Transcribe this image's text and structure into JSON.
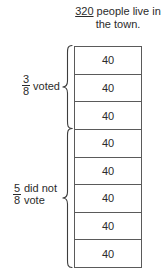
{
  "caption": {
    "total": "320",
    "text": " people live in the town."
  },
  "bar": {
    "cells": [
      {
        "value": "40"
      },
      {
        "value": "40"
      },
      {
        "value": "40"
      },
      {
        "value": "40"
      },
      {
        "value": "40"
      },
      {
        "value": "40"
      },
      {
        "value": "40"
      },
      {
        "value": "40"
      }
    ]
  },
  "groups": [
    {
      "id": "voted",
      "numerator": "3",
      "denominator": "8",
      "label": "voted",
      "cells": 3
    },
    {
      "id": "did-not-vote",
      "numerator": "5",
      "denominator": "8",
      "label": "did not vote",
      "cells": 5
    }
  ],
  "colors": {
    "border": "#5a5a5a",
    "text": "#2b2b2b",
    "background": "#ffffff"
  }
}
